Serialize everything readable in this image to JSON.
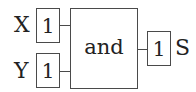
{
  "diagram": {
    "type": "logic-gate",
    "gate": {
      "label": "and"
    },
    "inputs": [
      {
        "name": "X",
        "value": "1"
      },
      {
        "name": "Y",
        "value": "1"
      }
    ],
    "output": {
      "name": "S",
      "value": "1"
    },
    "colors": {
      "stroke": "#4a4a4a",
      "text": "#222222",
      "background": "#ffffff"
    }
  }
}
